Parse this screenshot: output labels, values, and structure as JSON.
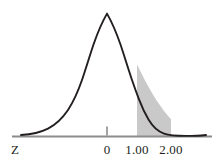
{
  "figure": {
    "kind": "standard-normal-distribution-curve",
    "background_color": "#ffffff",
    "curve_color": "#231f20",
    "axis_color": "#8c8c8c",
    "shading_color": "#c9c9c9"
  },
  "axis": {
    "variable_label": "Z",
    "tick_labels": [
      "0",
      "1.00",
      "2.00"
    ],
    "tick_values": [
      0,
      1,
      2
    ],
    "line_start_x": 12,
    "line_end_x": 212,
    "line_y": 136
  },
  "shaded_region": {
    "from_label": "1.00",
    "to_label": "2.00",
    "from_value": 1.0,
    "to_value": 2.0,
    "fill": "#c9c9c9"
  },
  "chart_data": {
    "type": "area",
    "title": "",
    "subtitle": "",
    "xlabel": "Z",
    "ylabel": "",
    "xlim": [
      -3.0,
      3.2
    ],
    "ylim": [
      0,
      0.42
    ],
    "grid": false,
    "legend": null,
    "distribution": {
      "name": "standard normal",
      "mean": 0,
      "sd": 1
    },
    "tick_labels": [
      "0",
      "1.00",
      "2.00"
    ],
    "x": [
      -3.0,
      -2.8,
      -2.6,
      -2.4,
      -2.2,
      -2.0,
      -1.8,
      -1.6,
      -1.4,
      -1.2,
      -1.0,
      -0.8,
      -0.6,
      -0.4,
      -0.2,
      0.0,
      0.2,
      0.4,
      0.6,
      0.8,
      1.0,
      1.2,
      1.4,
      1.6,
      1.8,
      2.0,
      2.2,
      2.4,
      2.6,
      2.8,
      3.0,
      3.2
    ],
    "values": [
      0.0044,
      0.0079,
      0.0136,
      0.0224,
      0.0355,
      0.054,
      0.079,
      0.1109,
      0.1497,
      0.1942,
      0.242,
      0.2897,
      0.3332,
      0.3683,
      0.391,
      0.3989,
      0.391,
      0.3683,
      0.3332,
      0.2897,
      0.242,
      0.1942,
      0.1497,
      0.1109,
      0.079,
      0.054,
      0.0355,
      0.0224,
      0.0136,
      0.0079,
      0.0044,
      0.0024
    ],
    "shaded_interval": [
      1.0,
      2.0
    ],
    "annotations": [
      "Z",
      "0",
      "1.00",
      "2.00"
    ]
  }
}
